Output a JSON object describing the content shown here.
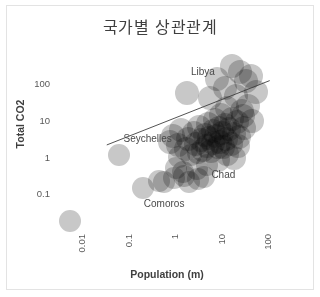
{
  "chart_data": {
    "type": "scatter",
    "title": "국가별 상관관계",
    "xlabel": "Population (m)",
    "ylabel": "Total CO2",
    "xscale": "log",
    "yscale": "log",
    "xlim": [
      0.004,
      300
    ],
    "ylim": [
      0.01,
      600
    ],
    "xticks": [
      "0.01",
      "0.1",
      "1",
      "10",
      "100"
    ],
    "xtick_values": [
      0.01,
      0.1,
      1,
      10,
      100
    ],
    "yticks": [
      "100",
      "10",
      "1",
      "0.1"
    ],
    "ytick_values": [
      100,
      10,
      1,
      0.1
    ],
    "grid": false,
    "legend": "none",
    "marker": "circle",
    "marker_color": "#a6a6a6",
    "marker_opacity": 0.62,
    "trendline": {
      "present": true,
      "color": "#404040",
      "x_start": 0.055,
      "y_start": 2.1,
      "x_end": 180,
      "y_end": 120
    },
    "annotations": [
      {
        "text": "Libya",
        "x": 6.5,
        "y": 220
      },
      {
        "text": "Seychelles",
        "x": 0.42,
        "y": 3.2
      },
      {
        "text": "Comoros",
        "x": 0.95,
        "y": 0.055
      },
      {
        "text": "Chad",
        "x": 18,
        "y": 0.33
      }
    ],
    "points": [
      {
        "x": 0.009,
        "y": 0.018,
        "r": 11
      },
      {
        "x": 0.1,
        "y": 1.15,
        "r": 11
      },
      {
        "x": 0.33,
        "y": 0.14,
        "r": 11
      },
      {
        "x": 0.75,
        "y": 0.22,
        "r": 11
      },
      {
        "x": 0.95,
        "y": 0.21,
        "r": 11
      },
      {
        "x": 1.55,
        "y": 0.26,
        "r": 11
      },
      {
        "x": 1.7,
        "y": 0.5,
        "r": 11
      },
      {
        "x": 2.6,
        "y": 0.3,
        "r": 11
      },
      {
        "x": 3.3,
        "y": 0.21,
        "r": 11
      },
      {
        "x": 5.2,
        "y": 0.25,
        "r": 11
      },
      {
        "x": 6.8,
        "y": 0.28,
        "r": 11
      },
      {
        "x": 1.25,
        "y": 2.5,
        "r": 12
      },
      {
        "x": 1.45,
        "y": 3.6,
        "r": 12
      },
      {
        "x": 1.9,
        "y": 2.1,
        "r": 12
      },
      {
        "x": 2.2,
        "y": 5.5,
        "r": 12
      },
      {
        "x": 2.0,
        "y": 1.0,
        "r": 11
      },
      {
        "x": 2.8,
        "y": 1.6,
        "r": 12
      },
      {
        "x": 3.1,
        "y": 3.0,
        "r": 12
      },
      {
        "x": 3.6,
        "y": 1.1,
        "r": 11
      },
      {
        "x": 4.2,
        "y": 4.5,
        "r": 12
      },
      {
        "x": 4.6,
        "y": 2.2,
        "r": 12
      },
      {
        "x": 5.0,
        "y": 1.3,
        "r": 11
      },
      {
        "x": 5.5,
        "y": 6.5,
        "r": 12
      },
      {
        "x": 6.0,
        "y": 2.8,
        "r": 12
      },
      {
        "x": 6.5,
        "y": 1.5,
        "r": 12
      },
      {
        "x": 7.2,
        "y": 4.0,
        "r": 12
      },
      {
        "x": 7.8,
        "y": 2.0,
        "r": 12
      },
      {
        "x": 8.5,
        "y": 8.0,
        "r": 12
      },
      {
        "x": 9.0,
        "y": 3.2,
        "r": 12
      },
      {
        "x": 9.6,
        "y": 1.4,
        "r": 12
      },
      {
        "x": 10.5,
        "y": 5.0,
        "r": 12
      },
      {
        "x": 11.0,
        "y": 2.4,
        "r": 12
      },
      {
        "x": 12.0,
        "y": 10.0,
        "r": 12
      },
      {
        "x": 12.5,
        "y": 3.8,
        "r": 12
      },
      {
        "x": 13.5,
        "y": 1.8,
        "r": 12
      },
      {
        "x": 14.5,
        "y": 6.0,
        "r": 12
      },
      {
        "x": 15.5,
        "y": 2.6,
        "r": 12
      },
      {
        "x": 16.0,
        "y": 14.0,
        "r": 12
      },
      {
        "x": 17.0,
        "y": 4.4,
        "r": 12
      },
      {
        "x": 18.0,
        "y": 1.9,
        "r": 12
      },
      {
        "x": 19.5,
        "y": 7.5,
        "r": 12
      },
      {
        "x": 21.0,
        "y": 3.0,
        "r": 12
      },
      {
        "x": 22.0,
        "y": 22.0,
        "r": 12
      },
      {
        "x": 24.0,
        "y": 5.8,
        "r": 12
      },
      {
        "x": 26.0,
        "y": 2.3,
        "r": 12
      },
      {
        "x": 28.0,
        "y": 11.0,
        "r": 12
      },
      {
        "x": 30.0,
        "y": 4.2,
        "r": 12
      },
      {
        "x": 33.0,
        "y": 45.0,
        "r": 12
      },
      {
        "x": 36.0,
        "y": 9.0,
        "r": 12
      },
      {
        "x": 40.0,
        "y": 3.4,
        "r": 12
      },
      {
        "x": 45.0,
        "y": 18.0,
        "r": 12
      },
      {
        "x": 50.0,
        "y": 6.2,
        "r": 12
      },
      {
        "x": 3.0,
        "y": 55.0,
        "r": 12
      },
      {
        "x": 9.5,
        "y": 40.0,
        "r": 12
      },
      {
        "x": 13.0,
        "y": 130.0,
        "r": 12
      },
      {
        "x": 20.0,
        "y": 75.0,
        "r": 12
      },
      {
        "x": 27.0,
        "y": 300.0,
        "r": 12
      },
      {
        "x": 42.0,
        "y": 210.0,
        "r": 12
      },
      {
        "x": 55.0,
        "y": 120.0,
        "r": 12
      },
      {
        "x": 70.0,
        "y": 160.0,
        "r": 12
      },
      {
        "x": 90.0,
        "y": 60.0,
        "r": 12
      },
      {
        "x": 60.0,
        "y": 25.0,
        "r": 12
      },
      {
        "x": 75.0,
        "y": 9.5,
        "r": 12
      },
      {
        "x": 48.0,
        "y": 13.0,
        "r": 12
      },
      {
        "x": 38.0,
        "y": 2.0,
        "r": 12
      },
      {
        "x": 30.0,
        "y": 0.9,
        "r": 12
      },
      {
        "x": 22.0,
        "y": 1.2,
        "r": 12
      },
      {
        "x": 14.0,
        "y": 0.8,
        "r": 12
      },
      {
        "x": 8.0,
        "y": 0.6,
        "r": 11
      },
      {
        "x": 4.8,
        "y": 0.45,
        "r": 11
      },
      {
        "x": 2.4,
        "y": 0.38,
        "r": 11
      }
    ]
  }
}
